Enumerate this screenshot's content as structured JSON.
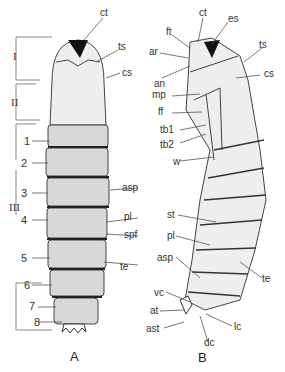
{
  "figure": {
    "panels": [
      {
        "id": "A",
        "view": "dorsal",
        "panel_label": "A",
        "regions": [
          {
            "label": "I",
            "span": "head"
          },
          {
            "label": "II",
            "span": "thorax"
          },
          {
            "label": "III",
            "span": "abdomen"
          }
        ],
        "segments": [
          "1",
          "2",
          "3",
          "4",
          "5",
          "6",
          "7",
          "8"
        ],
        "callouts": [
          "ct",
          "ts",
          "cs",
          "asp",
          "pl",
          "spf",
          "te"
        ]
      },
      {
        "id": "B",
        "view": "lateral",
        "panel_label": "B",
        "callouts": [
          "ct",
          "es",
          "ft",
          "ar",
          "an",
          "ts",
          "cs",
          "mp",
          "ff",
          "tb1",
          "tb2",
          "w",
          "st",
          "pl",
          "asp",
          "te",
          "vc",
          "at",
          "ast",
          "lc",
          "dc"
        ]
      }
    ]
  },
  "labels": {
    "A": {
      "ct": "ct",
      "ts": "ts",
      "cs": "cs",
      "asp": "asp",
      "pl": "pl",
      "spf": "spf",
      "te": "te",
      "r1": "I",
      "r2": "II",
      "r3": "III",
      "s1": "1",
      "s2": "2",
      "s3": "3",
      "s4": "4",
      "s5": "5",
      "s6": "6",
      "s7": "7",
      "s8": "8",
      "panel": "A"
    },
    "B": {
      "ct": "ct",
      "es": "es",
      "ft": "ft",
      "ar": "ar",
      "an": "an",
      "ts": "ts",
      "cs": "cs",
      "mp": "mp",
      "ff": "ff",
      "tb1": "tb1",
      "tb2": "tb2",
      "w": "w",
      "st": "st",
      "pl": "pl",
      "asp": "asp",
      "te": "te",
      "vc": "vc",
      "at": "at",
      "ast": "ast",
      "lc": "lc",
      "dc": "dc",
      "panel": "B"
    }
  },
  "colors": {
    "line": "#555555",
    "fill": "#e9e9e9",
    "dark": "#1a1a1a",
    "text": "#333333"
  }
}
